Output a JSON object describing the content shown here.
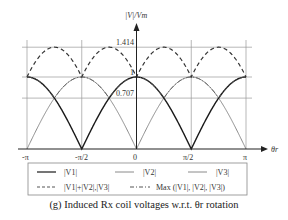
{
  "chart_data": {
    "type": "line",
    "title": "(g) Induced Rx coil voltages w.r.t. θr rotation",
    "xlabel": "θr",
    "ylabel": "|V|/Vm",
    "x_ticks": [
      "-π",
      "-π/2",
      "0",
      "π/2",
      "π"
    ],
    "x_range": [
      -3.1416,
      3.1416
    ],
    "y_ticks": [
      "0.707",
      "1",
      "1.414"
    ],
    "y_range": [
      0,
      1.414
    ],
    "grid": true,
    "legend_position": "below",
    "series": [
      {
        "name": "|V1|",
        "style": "solid-black",
        "formula": "|cos θ|",
        "x": [
          "-π",
          "-3π/4",
          "-π/2",
          "-π/4",
          "0",
          "π/4",
          "π/2",
          "3π/4",
          "π"
        ],
        "values": [
          1,
          0.707,
          0,
          0.707,
          1,
          0.707,
          0,
          0.707,
          1
        ]
      },
      {
        "name": "|V2|",
        "style": "solid-gray",
        "formula": "|sin θ|",
        "x": [
          "-π",
          "-3π/4",
          "-π/2",
          "-π/4",
          "0",
          "π/4",
          "π/2",
          "3π/4",
          "π"
        ],
        "values": [
          0,
          0.707,
          1,
          0.707,
          0,
          0.707,
          1,
          0.707,
          0
        ]
      },
      {
        "name": "|V3|",
        "style": "solid-gray",
        "formula": "|sin θ|",
        "x": [
          "-π",
          "-3π/4",
          "-π/2",
          "-π/4",
          "0",
          "π/4",
          "π/2",
          "3π/4",
          "π"
        ],
        "values": [
          0,
          0.707,
          1,
          0.707,
          0,
          0.707,
          1,
          0.707,
          0
        ]
      },
      {
        "name": "|V1|+|V2|,|V3|",
        "style": "dashed",
        "x": [
          "-π",
          "-3π/4",
          "-π/2",
          "-π/4",
          "0",
          "π/4",
          "π/2",
          "3π/4",
          "π"
        ],
        "values": [
          1,
          1.414,
          1,
          1.414,
          1,
          1.414,
          1,
          1.414,
          1
        ]
      },
      {
        "name": "Max (|V1|, |V2|, |V3|)",
        "style": "dash-dot",
        "x": [
          "-π",
          "-3π/4",
          "-π/2",
          "-π/4",
          "0",
          "π/4",
          "π/2",
          "3π/4",
          "π"
        ],
        "values": [
          1,
          0.707,
          1,
          0.707,
          1,
          0.707,
          1,
          0.707,
          1
        ]
      }
    ]
  },
  "axes": {
    "ylabel": "|V|/Vm",
    "xlabel": "θr",
    "y_tick_1414": "1.414",
    "y_tick_1": "1",
    "y_tick_0707": "0.707",
    "x_ticks": {
      "neg_pi": "-π",
      "neg_half_pi": "-π/2",
      "zero": "0",
      "half_pi": "π/2",
      "pi": "π"
    }
  },
  "legend": {
    "v1": "|V1|",
    "v2": "|V2|",
    "v3": "|V3|",
    "sum": "|V1|+|V2|,|V3|",
    "max": "Max (|V1|, |V2|, |V3|)"
  },
  "caption": "(g) Induced Rx coil voltages w.r.t. θr rotation",
  "colors": {
    "black": "#1a1a1a",
    "gray": "#8a8a8a",
    "grid": "#9a9a9a",
    "dashed": "#333333"
  }
}
